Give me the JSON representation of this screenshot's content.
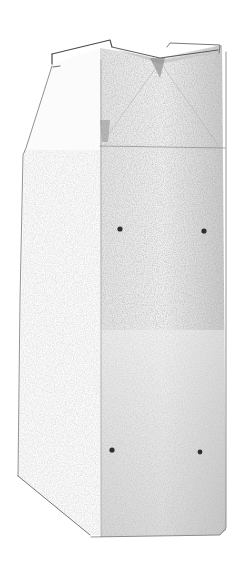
{
  "image": {
    "subject": "pencil sketch of a tall gable-top carton box",
    "width": 236,
    "height": 588,
    "background": "#ffffff",
    "ink": "#3a3a3a",
    "shade_light": "#d8d8d8",
    "shade_mid": "#bdbdbd",
    "shade_dark": "#8a8a8a",
    "dots": [
      {
        "x": 120,
        "y": 229
      },
      {
        "x": 204,
        "y": 231
      },
      {
        "x": 112,
        "y": 450
      },
      {
        "x": 200,
        "y": 452
      }
    ]
  }
}
